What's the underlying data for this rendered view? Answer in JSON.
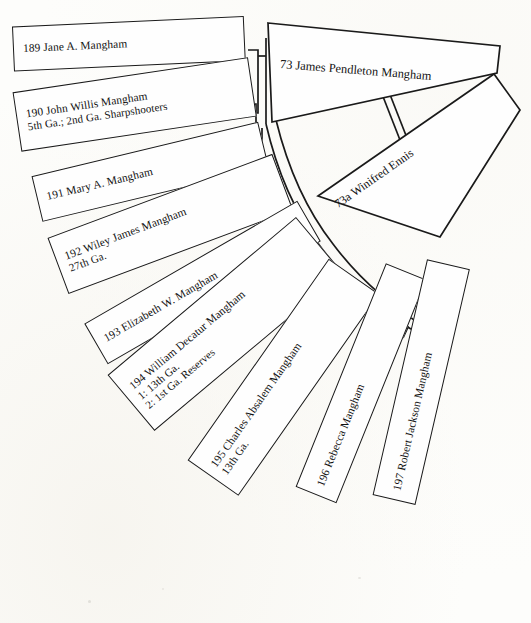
{
  "document": {
    "type": "genealogical-fan-chart",
    "title": "Mangham Family Fan Chart",
    "background_color": "#fdfdfb",
    "ink_color": "#1a1a1a"
  },
  "nodes": [
    {
      "id": "189",
      "number": "189",
      "name": "Jane A. Mangham",
      "label": "189 Jane A. Mangham",
      "detail": "",
      "generation": "spouse-parent",
      "angle_deg": -3
    },
    {
      "id": "73",
      "number": "73",
      "name": "James Pendleton Mangham",
      "label": "73 James Pendleton Mangham",
      "detail": "",
      "generation": "root",
      "angle_deg": 8
    },
    {
      "id": "190",
      "number": "190",
      "name": "John Willis Mangham",
      "label": "190 John Willis Mangham",
      "detail": "5th Ga.; 2nd Ga. Sharpshooters",
      "generation": "child",
      "angle_deg": -9
    },
    {
      "id": "73a",
      "number": "73a",
      "name": "Winifred Ennis",
      "label": "73a Winifred Ennis",
      "detail": "",
      "generation": "spouse",
      "angle_deg": 26
    },
    {
      "id": "191",
      "number": "191",
      "name": "Mary A. Mangham",
      "label": "191 Mary A. Mangham",
      "detail": "",
      "generation": "child",
      "angle_deg": -14
    },
    {
      "id": "192",
      "number": "192",
      "name": "Wiley James Mangham",
      "label": "192 Wiley James Mangham",
      "detail": "27th Ga.",
      "generation": "child",
      "angle_deg": -21
    },
    {
      "id": "193",
      "number": "193",
      "name": "Elizabeth W. Mangham",
      "label": "193 Elizabeth W. Mangham",
      "detail": "",
      "generation": "child",
      "angle_deg": -31
    },
    {
      "id": "194",
      "number": "194",
      "name": "William Decatur Mangham",
      "label": "194 William Decatur Mangham",
      "detail": "1: 13th Ga.",
      "detail2": "2: 1st Ga. Reserves",
      "generation": "child",
      "angle_deg": -41
    },
    {
      "id": "195",
      "number": "195",
      "name": "Charles Absalem Mangham",
      "label": "195 Charles Absalem Mangham",
      "detail": "13th Ga.",
      "generation": "child",
      "angle_deg": -55
    },
    {
      "id": "196",
      "number": "196",
      "name": "Rebecca Mangham",
      "label": "196 Rebecca Mangham",
      "detail": "",
      "generation": "child",
      "angle_deg": -68
    },
    {
      "id": "197",
      "number": "197",
      "name": "Robert Jackson Mangham",
      "label": "197 Robert Jackson Mangham",
      "detail": "",
      "generation": "child",
      "angle_deg": -78
    }
  ]
}
